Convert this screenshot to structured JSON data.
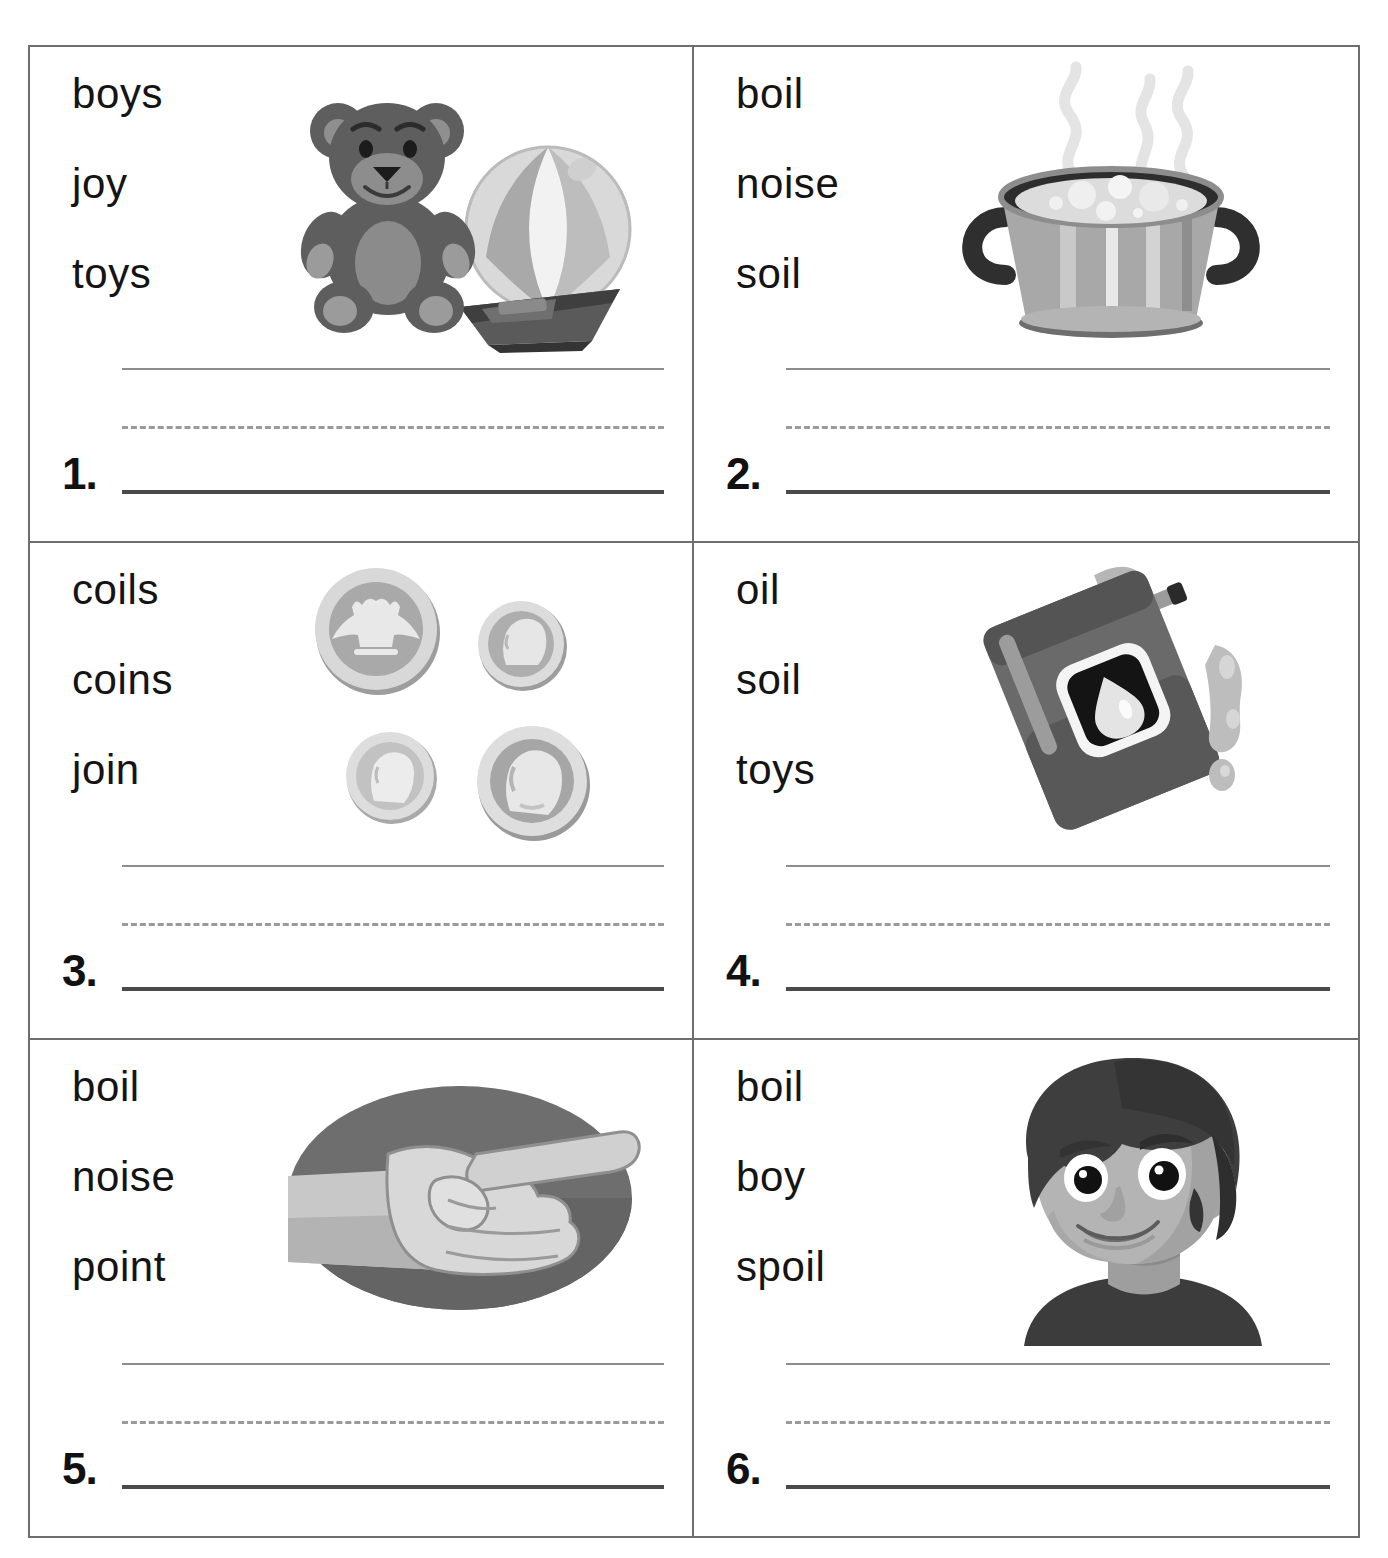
{
  "worksheet": {
    "title": "Oi / Oy Words Picture-Word Choice Worksheet",
    "grid": {
      "columns": 2,
      "rows": 3
    },
    "line_colors": {
      "border": "#6e6e6e",
      "top_line": "#8d8d8d",
      "dashed_line": "#9a9a9a",
      "answer_line": "#4a4a4a",
      "word_text": "#141414"
    },
    "items": [
      {
        "number": "1.",
        "words": [
          "boys",
          "joy",
          "toys"
        ],
        "picture": "teddy-bear-ball-boat-illustration",
        "picture_label": "teddy bear with beach ball and toy boat"
      },
      {
        "number": "2.",
        "words": [
          "boil",
          "noise",
          "soil"
        ],
        "picture": "boiling-pot-illustration",
        "picture_label": "steaming pot of boiling water"
      },
      {
        "number": "3.",
        "words": [
          "coils",
          "coins",
          "join"
        ],
        "picture": "coins-illustration",
        "picture_label": "four coins"
      },
      {
        "number": "4.",
        "words": [
          "oil",
          "soil",
          "toys"
        ],
        "picture": "oil-can-illustration",
        "picture_label": "tipped oil can pouring oil"
      },
      {
        "number": "5.",
        "words": [
          "boil",
          "noise",
          "point"
        ],
        "picture": "pointing-hand-illustration",
        "picture_label": "hand pointing on oval background"
      },
      {
        "number": "6.",
        "words": [
          "boil",
          "boy",
          "spoil"
        ],
        "picture": "boy-face-illustration",
        "picture_label": "smiling boy with dark hair"
      }
    ]
  }
}
